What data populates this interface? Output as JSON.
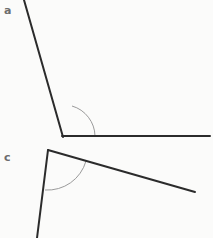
{
  "figure": {
    "background_color": "#fbfbfa",
    "ray_color": "#2b2b2b",
    "arc_color": "#9a9a9a",
    "label_color": "#6d6d6d",
    "ray_width": 2,
    "arc_width": 1,
    "width": 213,
    "height": 238
  },
  "angles": [
    {
      "id": "a",
      "label": "a",
      "label_position": {
        "x": 4,
        "y": 5
      },
      "vertex": {
        "x": 63,
        "y": 137
      },
      "rays": [
        {
          "name": "upper-left-ray",
          "to": {
            "x": 24,
            "y": 0
          }
        },
        {
          "name": "horizontal-right-ray",
          "to": {
            "x": 210,
            "y": 136
          }
        }
      ],
      "arc": {
        "radius": 32,
        "start_point": {
          "x": 95,
          "y": 136
        },
        "end_point": {
          "x": 72,
          "y": 106
        },
        "sweep": "counterclockwise"
      }
    },
    {
      "id": "c",
      "label": "c",
      "label_position": {
        "x": 4,
        "y": 152
      },
      "vertex": {
        "x": 48,
        "y": 150
      },
      "rays": [
        {
          "name": "lower-left-ray",
          "to": {
            "x": 37,
            "y": 238
          }
        },
        {
          "name": "right-descending-ray",
          "to": {
            "x": 195,
            "y": 192
          }
        }
      ],
      "arc": {
        "radius": 40,
        "start_point": {
          "x": 86,
          "y": 161
        },
        "end_point": {
          "x": 45,
          "y": 190
        },
        "sweep": "clockwise"
      }
    }
  ]
}
